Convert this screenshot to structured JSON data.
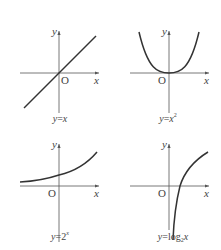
{
  "diagram": {
    "panels": [
      {
        "id": "linear",
        "caption": "y=x",
        "caption_parts": {
          "y": "y",
          "eq": "=",
          "rhs": "x"
        },
        "axis_labels": {
          "x": "x",
          "y": "y",
          "origin": "O"
        }
      },
      {
        "id": "quadratic",
        "caption": "y=x²",
        "caption_parts": {
          "y": "y",
          "eq": "=",
          "rhs": "x",
          "sup": "2"
        },
        "axis_labels": {
          "x": "x",
          "y": "y",
          "origin": "O"
        }
      },
      {
        "id": "exponential",
        "caption": "y=2ˣ",
        "caption_parts": {
          "y": "y",
          "eq": "=",
          "rhs": "2",
          "sup": "x"
        },
        "axis_labels": {
          "x": "x",
          "y": "y",
          "origin": "O"
        }
      },
      {
        "id": "logarithm",
        "caption": "y=log₂x",
        "caption_parts": {
          "y": "y",
          "eq": "=",
          "rhs": "log",
          "sub": "2",
          "arg": "x"
        },
        "axis_labels": {
          "x": "x",
          "y": "y",
          "origin": "O"
        }
      }
    ],
    "colors": {
      "curve": "#333333",
      "axis": "#555555",
      "text": "#444444",
      "background": "#ffffff"
    }
  }
}
